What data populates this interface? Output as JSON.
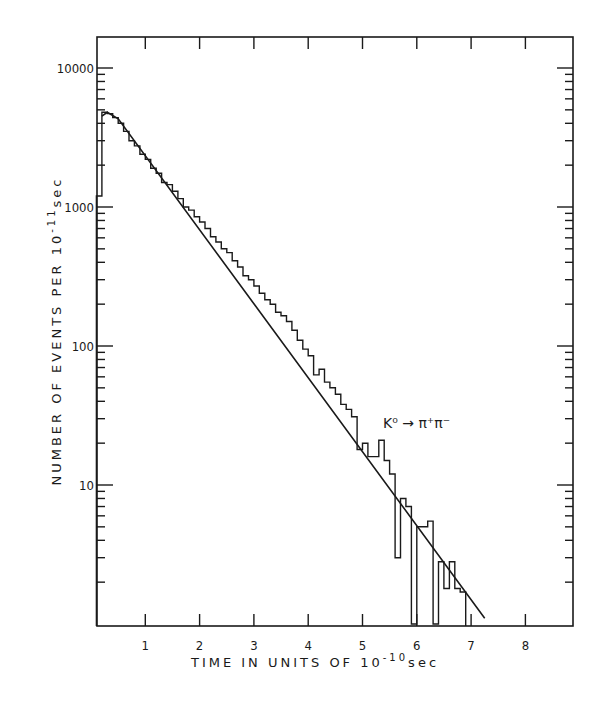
{
  "chart_data": {
    "type": "bar",
    "subtype": "histogram_with_fit_line",
    "title": "",
    "xlabel": "TIME IN UNITS OF 10^-10 sec",
    "xlabel_parts": {
      "main": "TIME IN UNITS OF 10",
      "exp": "-10",
      "unit": "sec"
    },
    "ylabel": "NUMBER OF EVENTS PER 10^-11 sec",
    "ylabel_parts": {
      "main": "NUMBER OF EVENTS PER 10",
      "exp": "-11",
      "unit": "sec"
    },
    "yscale": "log",
    "xlim": [
      0.1,
      8.9
    ],
    "ylim": [
      1.1,
      20000
    ],
    "x_ticks": [
      1,
      2,
      3,
      4,
      5,
      6,
      7,
      8
    ],
    "x_tick_labels": [
      "1",
      "2",
      "3",
      "4",
      "5",
      "6",
      "7",
      "8"
    ],
    "y_ticks": [
      10,
      100,
      1000,
      10000
    ],
    "y_tick_labels": [
      "10",
      "100",
      "1000",
      "10000"
    ],
    "grid": false,
    "legend": null,
    "annotation": {
      "text": "K⁰ → π⁺π⁻",
      "x": 5.4,
      "y": 30
    },
    "histogram": {
      "bin_width": 0.1,
      "bins": [
        {
          "x0": 0.1,
          "x1": 0.2,
          "y": 1200
        },
        {
          "x0": 0.2,
          "x1": 0.3,
          "y": 4800
        },
        {
          "x0": 0.3,
          "x1": 0.4,
          "y": 4700
        },
        {
          "x0": 0.4,
          "x1": 0.5,
          "y": 4400
        },
        {
          "x0": 0.5,
          "x1": 0.6,
          "y": 4000
        },
        {
          "x0": 0.6,
          "x1": 0.7,
          "y": 3500
        },
        {
          "x0": 0.7,
          "x1": 0.8,
          "y": 3000
        },
        {
          "x0": 0.8,
          "x1": 0.9,
          "y": 2750
        },
        {
          "x0": 0.9,
          "x1": 1.0,
          "y": 2400
        },
        {
          "x0": 1.0,
          "x1": 1.1,
          "y": 2200
        },
        {
          "x0": 1.1,
          "x1": 1.2,
          "y": 1900
        },
        {
          "x0": 1.2,
          "x1": 1.3,
          "y": 1750
        },
        {
          "x0": 1.3,
          "x1": 1.4,
          "y": 1500
        },
        {
          "x0": 1.4,
          "x1": 1.5,
          "y": 1450
        },
        {
          "x0": 1.5,
          "x1": 1.6,
          "y": 1300
        },
        {
          "x0": 1.6,
          "x1": 1.7,
          "y": 1150
        },
        {
          "x0": 1.7,
          "x1": 1.8,
          "y": 1000
        },
        {
          "x0": 1.8,
          "x1": 1.9,
          "y": 950
        },
        {
          "x0": 1.9,
          "x1": 2.0,
          "y": 850
        },
        {
          "x0": 2.0,
          "x1": 2.1,
          "y": 780
        },
        {
          "x0": 2.1,
          "x1": 2.2,
          "y": 700
        },
        {
          "x0": 2.2,
          "x1": 2.3,
          "y": 610
        },
        {
          "x0": 2.3,
          "x1": 2.4,
          "y": 560
        },
        {
          "x0": 2.4,
          "x1": 2.5,
          "y": 500
        },
        {
          "x0": 2.5,
          "x1": 2.6,
          "y": 470
        },
        {
          "x0": 2.6,
          "x1": 2.7,
          "y": 410
        },
        {
          "x0": 2.7,
          "x1": 2.8,
          "y": 370
        },
        {
          "x0": 2.8,
          "x1": 2.9,
          "y": 320
        },
        {
          "x0": 2.9,
          "x1": 3.0,
          "y": 300
        },
        {
          "x0": 3.0,
          "x1": 3.1,
          "y": 270
        },
        {
          "x0": 3.1,
          "x1": 3.2,
          "y": 240
        },
        {
          "x0": 3.2,
          "x1": 3.3,
          "y": 215
        },
        {
          "x0": 3.3,
          "x1": 3.4,
          "y": 200
        },
        {
          "x0": 3.4,
          "x1": 3.5,
          "y": 175
        },
        {
          "x0": 3.5,
          "x1": 3.6,
          "y": 165
        },
        {
          "x0": 3.6,
          "x1": 3.7,
          "y": 150
        },
        {
          "x0": 3.7,
          "x1": 3.8,
          "y": 130
        },
        {
          "x0": 3.8,
          "x1": 3.9,
          "y": 110
        },
        {
          "x0": 3.9,
          "x1": 4.0,
          "y": 95
        },
        {
          "x0": 4.0,
          "x1": 4.1,
          "y": 85
        },
        {
          "x0": 4.1,
          "x1": 4.2,
          "y": 62
        },
        {
          "x0": 4.2,
          "x1": 4.3,
          "y": 68
        },
        {
          "x0": 4.3,
          "x1": 4.4,
          "y": 55
        },
        {
          "x0": 4.4,
          "x1": 4.5,
          "y": 50
        },
        {
          "x0": 4.5,
          "x1": 4.6,
          "y": 45
        },
        {
          "x0": 4.6,
          "x1": 4.7,
          "y": 38
        },
        {
          "x0": 4.7,
          "x1": 4.8,
          "y": 35
        },
        {
          "x0": 4.8,
          "x1": 4.9,
          "y": 31
        },
        {
          "x0": 4.9,
          "x1": 5.0,
          "y": 18
        },
        {
          "x0": 5.0,
          "x1": 5.1,
          "y": 20
        },
        {
          "x0": 5.1,
          "x1": 5.2,
          "y": 16
        },
        {
          "x0": 5.2,
          "x1": 5.3,
          "y": 16
        },
        {
          "x0": 5.3,
          "x1": 5.4,
          "y": 21
        },
        {
          "x0": 5.4,
          "x1": 5.5,
          "y": 15
        },
        {
          "x0": 5.5,
          "x1": 5.6,
          "y": 12
        },
        {
          "x0": 5.6,
          "x1": 5.7,
          "y": 3
        },
        {
          "x0": 5.7,
          "x1": 5.8,
          "y": 8
        },
        {
          "x0": 5.8,
          "x1": 5.9,
          "y": 7
        },
        {
          "x0": 5.9,
          "x1": 6.0,
          "y": 1
        },
        {
          "x0": 6.0,
          "x1": 6.1,
          "y": 5
        },
        {
          "x0": 6.1,
          "x1": 6.2,
          "y": 5
        },
        {
          "x0": 6.2,
          "x1": 6.3,
          "y": 5.5
        },
        {
          "x0": 6.3,
          "x1": 6.4,
          "y": 1
        },
        {
          "x0": 6.4,
          "x1": 6.5,
          "y": 2.8
        },
        {
          "x0": 6.5,
          "x1": 6.6,
          "y": 1.8
        },
        {
          "x0": 6.6,
          "x1": 6.7,
          "y": 2.8
        },
        {
          "x0": 6.7,
          "x1": 6.8,
          "y": 1.8
        },
        {
          "x0": 6.8,
          "x1": 6.9,
          "y": 1.7
        }
      ]
    },
    "fit_line": {
      "type": "exponential",
      "points": [
        [
          0.2,
          4500
        ],
        [
          0.3,
          4800
        ],
        [
          0.5,
          4300
        ],
        [
          7.25,
          1.1
        ]
      ],
      "description": "Exponential decay fit from peak ~4800 at t≈0.3 down to ~1.1 at t≈7.25"
    }
  }
}
